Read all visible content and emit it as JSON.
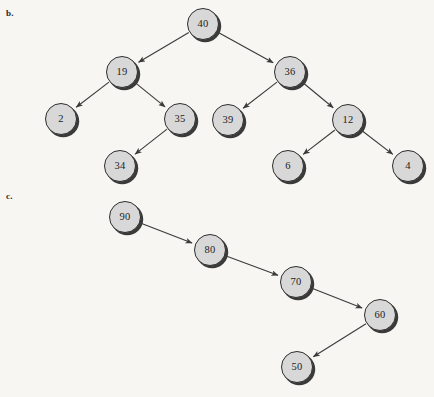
{
  "figure": {
    "background_color": "#f7f6f2",
    "node_fill_color": "#d8d8d8",
    "node_border_color": "#2e2e2e",
    "edge_color": "#3a3a3a",
    "text_color": "#1c1c1c"
  },
  "parts": [
    {
      "id": "b",
      "label": "b.",
      "label_x": 6,
      "label_y": 8,
      "type": "binary-tree",
      "nodes": [
        {
          "id": "b40",
          "value": "40",
          "cx": 203,
          "cy": 24
        },
        {
          "id": "b19",
          "value": "19",
          "cx": 122,
          "cy": 72
        },
        {
          "id": "b36",
          "value": "36",
          "cx": 290,
          "cy": 72
        },
        {
          "id": "b2",
          "value": "2",
          "cx": 61,
          "cy": 119
        },
        {
          "id": "b35",
          "value": "35",
          "cx": 180,
          "cy": 119
        },
        {
          "id": "b39",
          "value": "39",
          "cx": 228,
          "cy": 120
        },
        {
          "id": "b12",
          "value": "12",
          "cx": 348,
          "cy": 120
        },
        {
          "id": "b34",
          "value": "34",
          "cx": 120,
          "cy": 166
        },
        {
          "id": "b6",
          "value": "6",
          "cx": 288,
          "cy": 166
        },
        {
          "id": "b4",
          "value": "4",
          "cx": 408,
          "cy": 166
        }
      ],
      "edges": [
        {
          "from": "b40",
          "to": "b19"
        },
        {
          "from": "b40",
          "to": "b36"
        },
        {
          "from": "b19",
          "to": "b2"
        },
        {
          "from": "b19",
          "to": "b35"
        },
        {
          "from": "b36",
          "to": "b39"
        },
        {
          "from": "b36",
          "to": "b12"
        },
        {
          "from": "b35",
          "to": "b34"
        },
        {
          "from": "b12",
          "to": "b6"
        },
        {
          "from": "b12",
          "to": "b4"
        }
      ]
    },
    {
      "id": "c",
      "label": "c.",
      "label_x": 6,
      "label_y": 191,
      "type": "binary-tree",
      "nodes": [
        {
          "id": "c90",
          "value": "90",
          "cx": 125,
          "cy": 217
        },
        {
          "id": "c80",
          "value": "80",
          "cx": 210,
          "cy": 250
        },
        {
          "id": "c70",
          "value": "70",
          "cx": 296,
          "cy": 282
        },
        {
          "id": "c60",
          "value": "60",
          "cx": 380,
          "cy": 315
        },
        {
          "id": "c50",
          "value": "50",
          "cx": 297,
          "cy": 367
        }
      ],
      "edges": [
        {
          "from": "c90",
          "to": "c80"
        },
        {
          "from": "c80",
          "to": "c70"
        },
        {
          "from": "c70",
          "to": "c60"
        },
        {
          "from": "c60",
          "to": "c50"
        }
      ]
    }
  ],
  "chart_data": {
    "type": "diagram",
    "title": "",
    "subfigures": [
      {
        "label": "b.",
        "structure": "binary search tree",
        "root": "40",
        "adjacency": {
          "40": {
            "left": "19",
            "right": "36"
          },
          "19": {
            "left": "2",
            "right": "35"
          },
          "36": {
            "left": "39",
            "right": "12"
          },
          "35": {
            "left": "34",
            "right": null
          },
          "12": {
            "left": "6",
            "right": "4"
          },
          "2": {
            "left": null,
            "right": null
          },
          "39": {
            "left": null,
            "right": null
          },
          "34": {
            "left": null,
            "right": null
          },
          "6": {
            "left": null,
            "right": null
          },
          "4": {
            "left": null,
            "right": null
          }
        },
        "node_values": [
          "40",
          "19",
          "36",
          "2",
          "35",
          "39",
          "12",
          "34",
          "6",
          "4"
        ]
      },
      {
        "label": "c.",
        "structure": "right-skewed then left chain",
        "root": "90",
        "adjacency": {
          "90": {
            "left": null,
            "right": "80"
          },
          "80": {
            "left": null,
            "right": "70"
          },
          "70": {
            "left": null,
            "right": "60"
          },
          "60": {
            "left": "50",
            "right": null
          },
          "50": {
            "left": null,
            "right": null
          }
        },
        "node_values": [
          "90",
          "80",
          "70",
          "60",
          "50"
        ]
      }
    ]
  }
}
